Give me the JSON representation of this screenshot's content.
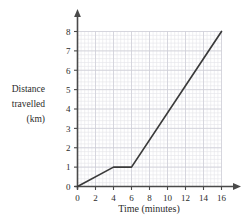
{
  "chart_data": {
    "type": "line",
    "title": "",
    "subtitle": "",
    "xlabel": "Time (minutes)",
    "ylabel": "Distance travelled (km)",
    "ylabel_lines": [
      "Distance",
      "travelled",
      "(km)"
    ],
    "xlim": [
      0,
      16
    ],
    "ylim": [
      0,
      8
    ],
    "xticks": [
      0,
      2,
      4,
      6,
      8,
      10,
      12,
      14,
      16
    ],
    "xtick_labels": [
      "0",
      "2",
      "4",
      "6",
      "8",
      "10",
      "12",
      "14",
      "16"
    ],
    "yticks": [
      0,
      1,
      2,
      3,
      4,
      5,
      6,
      7,
      8
    ],
    "ytick_labels": [
      "0",
      "1",
      "2",
      "3",
      "4",
      "5",
      "6",
      "7",
      "8"
    ],
    "grid": true,
    "grid_minor_step_x": 0.4,
    "grid_minor_step_y": 0.2,
    "grid_major_step_x": 2,
    "grid_major_step_y": 1,
    "legend": false,
    "legend_position": "none",
    "axis_arrows": true,
    "series": [
      {
        "name": "Distance travelled",
        "color": "#3a3a3a",
        "x": [
          0,
          4,
          6,
          16
        ],
        "y": [
          0,
          1,
          1,
          8
        ],
        "points": [
          {
            "x": 0,
            "y": 0
          },
          {
            "x": 4,
            "y": 1
          },
          {
            "x": 6,
            "y": 1
          },
          {
            "x": 16,
            "y": 8
          }
        ]
      }
    ],
    "annotations": []
  },
  "colors": {
    "line": "#3a3a3a",
    "axis": "#4a4a4a",
    "grid_minor": "#e4e4ea",
    "grid_major": "#cfcfd8",
    "text": "#2b2b2b",
    "background": "#ffffff"
  }
}
